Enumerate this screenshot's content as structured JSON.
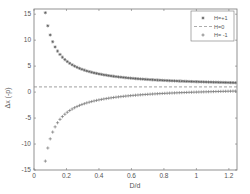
{
  "chart_data": {
    "type": "scatter",
    "title": "",
    "xlabel": "D/d",
    "ylabel": "Δx (-p)",
    "xlim": [
      0,
      1.25
    ],
    "ylim": [
      -15,
      16
    ],
    "xticks": [
      0,
      0.2,
      0.4,
      0.6,
      0.8,
      1,
      1.2
    ],
    "xtick_labels": [
      "0",
      "0.2",
      "0.4",
      "0.6",
      "0.8",
      "1",
      "1.2"
    ],
    "yticks": [
      -15,
      -10,
      -5,
      0,
      5,
      10,
      15
    ],
    "ytick_labels": [
      "-15",
      "-10",
      "-5",
      "0",
      "5",
      "10",
      "15"
    ],
    "grid": false,
    "legend_position": "upper right",
    "x_start": 0.07,
    "x_end": 1.25,
    "x_step": 0.015,
    "series": [
      {
        "name": "H=+1",
        "marker": "*",
        "formula": "1 + 1/x",
        "values_sample": [
          {
            "x": 0.07,
            "y": 15.3
          },
          {
            "x": 0.1,
            "y": 11
          },
          {
            "x": 0.2,
            "y": 6
          },
          {
            "x": 0.4,
            "y": 3.5
          },
          {
            "x": 0.8,
            "y": 2.25
          },
          {
            "x": 1.2,
            "y": 1.83
          }
        ]
      },
      {
        "name": "H=0",
        "marker": "dashed-line",
        "formula": "1",
        "values_sample": [
          {
            "x": 0,
            "y": 1
          },
          {
            "x": 1.25,
            "y": 1
          }
        ]
      },
      {
        "name": "H= -1",
        "marker": "+",
        "formula": "1 - 1/x",
        "values_sample": [
          {
            "x": 0.07,
            "y": -13.3
          },
          {
            "x": 0.1,
            "y": -9
          },
          {
            "x": 0.2,
            "y": -4
          },
          {
            "x": 0.4,
            "y": -1.5
          },
          {
            "x": 0.8,
            "y": -0.25
          },
          {
            "x": 1.2,
            "y": 0.17
          }
        ]
      }
    ]
  }
}
